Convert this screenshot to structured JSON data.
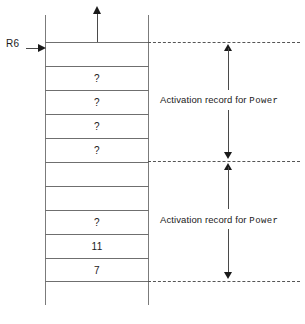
{
  "diagram": {
    "pointer": {
      "register_label": "R6"
    },
    "growth_arrow": {
      "name": "stack-growth-arrow",
      "direction": "up"
    },
    "stack_cells": [
      {
        "value": "",
        "row": 0
      },
      {
        "value": "?",
        "row": 1
      },
      {
        "value": "?",
        "row": 2
      },
      {
        "value": "?",
        "row": 3
      },
      {
        "value": "?",
        "row": 4
      },
      {
        "value": "",
        "row": 5
      },
      {
        "value": "",
        "row": 6
      },
      {
        "value": "?",
        "row": 7
      },
      {
        "value": "11",
        "row": 8
      },
      {
        "value": "7",
        "row": 9
      }
    ],
    "annotations": [
      {
        "prefix": "Activation record for ",
        "routine": "Power"
      },
      {
        "prefix": "Activation record for ",
        "routine": "Power"
      }
    ],
    "colors": {
      "line": "#6f6f6f",
      "arrow": "#1a1a1a",
      "dashed": "#555555",
      "text": "#1a1a1a",
      "background": "#ffffff"
    }
  }
}
